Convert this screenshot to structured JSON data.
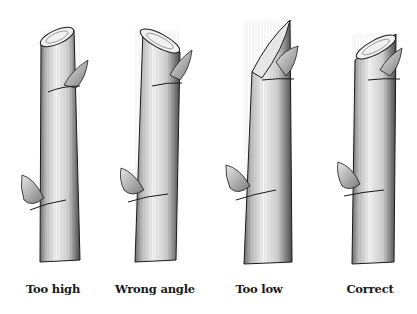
{
  "figure": {
    "panels": [
      {
        "label": "Too high",
        "center_x": 53
      },
      {
        "label": "Wrong angle",
        "center_x": 155
      },
      {
        "label": "Too low",
        "center_x": 259
      },
      {
        "label": "Correct",
        "center_x": 370
      }
    ]
  },
  "colors": {
    "ink": "#1a1a1a",
    "stem_light": "#f2f2f2",
    "stem_shade": "#8a8a8a",
    "background": "#ffffff"
  }
}
